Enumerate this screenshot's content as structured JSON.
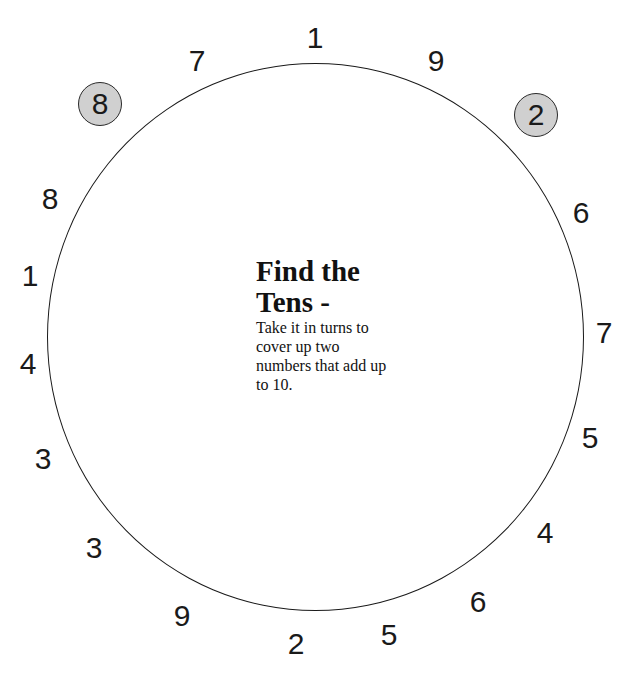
{
  "title_line1": "Find the",
  "title_line2": "Tens -",
  "instructions": "Take it in turns to cover up two numbers that add up to 10.",
  "numbers": [
    {
      "value": "1",
      "x": 315,
      "y": 38
    },
    {
      "value": "9",
      "x": 436,
      "y": 61
    },
    {
      "value": "6",
      "x": 581,
      "y": 213
    },
    {
      "value": "7",
      "x": 604,
      "y": 333
    },
    {
      "value": "5",
      "x": 590,
      "y": 438
    },
    {
      "value": "4",
      "x": 545,
      "y": 533
    },
    {
      "value": "6",
      "x": 478,
      "y": 602
    },
    {
      "value": "5",
      "x": 389,
      "y": 635
    },
    {
      "value": "2",
      "x": 296,
      "y": 644
    },
    {
      "value": "9",
      "x": 182,
      "y": 616
    },
    {
      "value": "3",
      "x": 94,
      "y": 548
    },
    {
      "value": "3",
      "x": 43,
      "y": 459
    },
    {
      "value": "4",
      "x": 28,
      "y": 364
    },
    {
      "value": "1",
      "x": 30,
      "y": 276
    },
    {
      "value": "8",
      "x": 50,
      "y": 199
    },
    {
      "value": "7",
      "x": 197,
      "y": 61
    }
  ],
  "counters": [
    {
      "value": "8",
      "x": 100,
      "y": 104
    },
    {
      "value": "2",
      "x": 536,
      "y": 115
    }
  ],
  "colors": {
    "ring": "#1a1a1a",
    "counter_fill": "#d0d0d0"
  }
}
